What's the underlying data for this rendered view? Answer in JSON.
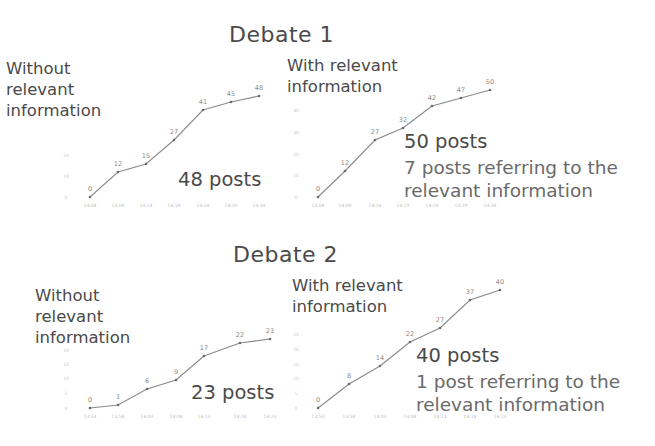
{
  "debates": [
    {
      "title": "Debate 1",
      "without": {
        "label_lines": [
          "Without",
          "relevant",
          "information"
        ],
        "posts_label": "48 posts"
      },
      "with": {
        "label_lines": [
          "With relevant",
          "information"
        ],
        "posts_label": "50 posts",
        "refer_lines": [
          "7 posts referring to the",
          "relevant information"
        ]
      }
    },
    {
      "title": "Debate 2",
      "without": {
        "label_lines": [
          "Without",
          "relevant",
          "information"
        ],
        "posts_label": "23 posts"
      },
      "with": {
        "label_lines": [
          "With relevant",
          "information"
        ],
        "posts_label": "40 posts",
        "refer_lines": [
          "1 post referring to the",
          "relevant information"
        ]
      }
    }
  ],
  "chart_data": [
    {
      "type": "line",
      "title": "Debate 1 - Without relevant information",
      "categories": [
        "14:04",
        "14:09",
        "14:14",
        "14:19",
        "14:24",
        "14:29",
        "14:34"
      ],
      "values": [
        0,
        12,
        15,
        27,
        41,
        45,
        48
      ],
      "xlabel": "",
      "ylabel": "Cumulative posts",
      "yticks": [
        0,
        10,
        20
      ],
      "annotation": "48 posts",
      "grid": false,
      "points_px": [
        [
          90,
          197
        ],
        [
          118,
          172
        ],
        [
          146,
          164
        ],
        [
          174,
          140
        ],
        [
          203,
          110
        ],
        [
          231,
          102
        ],
        [
          259,
          96
        ]
      ],
      "ytick_px": [
        [
          66,
          197
        ],
        [
          66,
          176
        ],
        [
          66,
          155
        ]
      ],
      "xtick_y": 207
    },
    {
      "type": "line",
      "title": "Debate 1 - With relevant information",
      "categories": [
        "14:04",
        "14:09",
        "14:14",
        "14:19",
        "14:24",
        "14:29",
        "14:34"
      ],
      "values": [
        0,
        12,
        27,
        32,
        42,
        47,
        50
      ],
      "xlabel": "",
      "ylabel": "Cumulative posts",
      "yticks": [
        0,
        10,
        20,
        30,
        40
      ],
      "annotation": "50 posts; 7 posts referring to the relevant information",
      "grid": false,
      "points_px": [
        [
          318,
          197
        ],
        [
          345,
          171
        ],
        [
          375,
          140
        ],
        [
          403,
          128
        ],
        [
          432,
          106
        ],
        [
          461,
          98
        ],
        [
          490,
          90
        ]
      ],
      "ytick_px": [
        [
          296,
          197
        ],
        [
          296,
          175
        ],
        [
          296,
          154
        ],
        [
          296,
          132
        ],
        [
          296,
          110
        ]
      ],
      "xtick_y": 207
    },
    {
      "type": "line",
      "title": "Debate 2 - Without relevant information",
      "categories": [
        "13:53",
        "13:58",
        "14:03",
        "14:08",
        "14:13",
        "14:18",
        "14:23"
      ],
      "values": [
        0,
        1,
        6,
        9,
        17,
        22,
        23
      ],
      "xlabel": "",
      "ylabel": "Cumulative posts",
      "yticks": [
        0,
        5,
        10,
        15,
        20,
        25
      ],
      "annotation": "23 posts",
      "grid": false,
      "points_px": [
        [
          90,
          408
        ],
        [
          118,
          405
        ],
        [
          147,
          389
        ],
        [
          176,
          380
        ],
        [
          204,
          356
        ],
        [
          240,
          343
        ],
        [
          270,
          339
        ]
      ],
      "ytick_px": [
        [
          66,
          408
        ],
        [
          66,
          393
        ],
        [
          66,
          378
        ],
        [
          66,
          364
        ],
        [
          66,
          350
        ]
      ],
      "xtick_y": 418
    },
    {
      "type": "line",
      "title": "Debate 2 - With relevant information",
      "categories": [
        "13:53",
        "13:58",
        "14:03",
        "14:08",
        "14:13",
        "14:18",
        "14:23"
      ],
      "values": [
        0,
        8,
        14,
        22,
        27,
        37,
        40
      ],
      "xlabel": "",
      "ylabel": "Cumulative posts",
      "yticks": [
        0,
        5,
        10,
        15,
        20,
        25
      ],
      "annotation": "40 posts; 1 post referring to the relevant information",
      "grid": false,
      "points_px": [
        [
          318,
          408
        ],
        [
          349,
          384
        ],
        [
          380,
          366
        ],
        [
          410,
          342
        ],
        [
          440,
          328
        ],
        [
          470,
          300
        ],
        [
          500,
          290
        ]
      ],
      "ytick_px": [
        [
          296,
          408
        ],
        [
          296,
          393
        ],
        [
          296,
          378
        ],
        [
          296,
          364
        ],
        [
          296,
          349
        ],
        [
          296,
          334
        ]
      ],
      "xtick_y": 418
    }
  ]
}
